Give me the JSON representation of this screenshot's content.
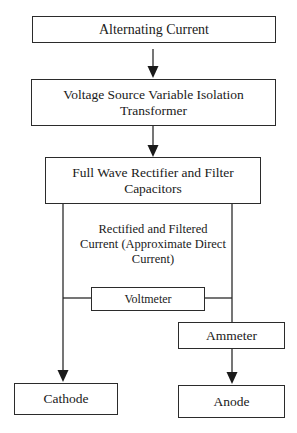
{
  "diagram": {
    "type": "flowchart",
    "nodes": {
      "alternating_current": "Alternating Current",
      "transformer": "Voltage Source Variable Isolation Transformer",
      "rectifier": "Full Wave Rectifier and Filter Capacitors",
      "voltmeter": "Voltmeter",
      "ammeter": "Ammeter",
      "cathode": "Cathode",
      "anode": "Anode"
    },
    "annotations": {
      "dc_label": "Rectified and Filtered Current (Approximate Direct Current)"
    },
    "edges": [
      {
        "from": "Alternating Current",
        "to": "Voltage Source Variable Isolation Transformer",
        "arrow": true
      },
      {
        "from": "Voltage Source Variable Isolation Transformer",
        "to": "Full Wave Rectifier and Filter Capacitors",
        "arrow": true
      },
      {
        "from": "Full Wave Rectifier and Filter Capacitors",
        "to": "Cathode",
        "arrow": true
      },
      {
        "from": "Full Wave Rectifier and Filter Capacitors",
        "to": "Ammeter",
        "arrow": false
      },
      {
        "from": "Ammeter",
        "to": "Anode",
        "arrow": true
      },
      {
        "from": "Voltmeter",
        "to": "cathode-line",
        "arrow": false
      },
      {
        "from": "Voltmeter",
        "to": "anode-line",
        "arrow": false
      }
    ],
    "colors": {
      "line": "#2b2b2b",
      "background": "#ffffff"
    }
  }
}
